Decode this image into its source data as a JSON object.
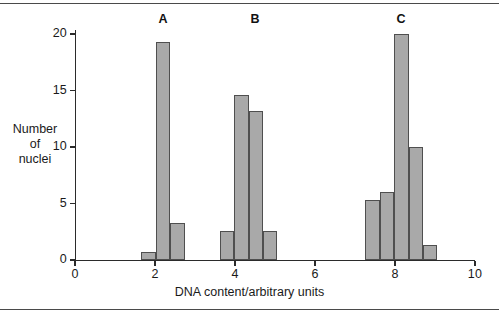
{
  "chart_data": {
    "type": "bar",
    "title": "",
    "subtitle": "",
    "xlabel": "DNA content/arbitrary units",
    "ylabel_lines": [
      "Number",
      "of",
      "nuclei"
    ],
    "ylabel": "Number of nuclei",
    "xlim": [
      0,
      10
    ],
    "ylim": [
      0,
      20
    ],
    "grid": false,
    "legend": null,
    "x_ticks": [
      0,
      2,
      4,
      6,
      8,
      10
    ],
    "x_tick_labels": [
      "0",
      "2",
      "4",
      "6",
      "8",
      "10"
    ],
    "y_ticks": [
      0,
      5,
      10,
      15,
      20
    ],
    "y_tick_labels": [
      "0",
      "5",
      "10",
      "15",
      "20"
    ],
    "bar_fill": "#a9a9a9",
    "bar_edge": "#4f4f4f",
    "bin_width": 0.36,
    "bars": [
      {
        "group": "A",
        "x_left": 1.66,
        "x_right": 2.02,
        "value": 0.7
      },
      {
        "group": "A",
        "x_left": 2.02,
        "x_right": 2.38,
        "value": 19.3
      },
      {
        "group": "A",
        "x_left": 2.38,
        "x_right": 2.74,
        "value": 3.3
      },
      {
        "group": "B",
        "x_left": 3.62,
        "x_right": 3.98,
        "value": 2.6
      },
      {
        "group": "B",
        "x_left": 3.98,
        "x_right": 4.34,
        "value": 14.6
      },
      {
        "group": "B",
        "x_left": 4.34,
        "x_right": 4.7,
        "value": 13.2
      },
      {
        "group": "B",
        "x_left": 4.7,
        "x_right": 5.06,
        "value": 2.6
      },
      {
        "group": "C",
        "x_left": 7.26,
        "x_right": 7.62,
        "value": 5.3
      },
      {
        "group": "C",
        "x_left": 7.62,
        "x_right": 7.98,
        "value": 6.0
      },
      {
        "group": "C",
        "x_left": 7.98,
        "x_right": 8.34,
        "value": 20.0
      },
      {
        "group": "C",
        "x_left": 8.34,
        "x_right": 8.7,
        "value": 10.0
      },
      {
        "group": "C",
        "x_left": 8.7,
        "x_right": 9.06,
        "value": 1.3
      }
    ],
    "annotations": [
      {
        "label": "A",
        "x": 2.2,
        "y": 21.2
      },
      {
        "label": "B",
        "x": 4.5,
        "y": 21.2
      },
      {
        "label": "C",
        "x": 8.15,
        "y": 21.2
      }
    ]
  }
}
